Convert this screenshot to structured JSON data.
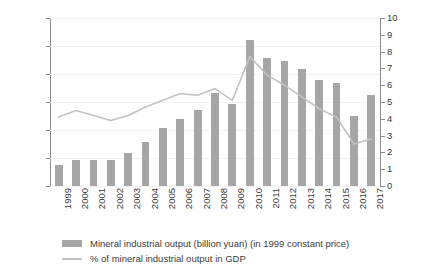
{
  "chart_data": {
    "type": "bar",
    "title": "",
    "subtitle": "",
    "xlabel": "",
    "ylabel": "",
    "grid": true,
    "legend_position": "bottom",
    "categories": [
      "1999",
      "2000",
      "2001",
      "2002",
      "2003",
      "2004",
      "2005",
      "2006",
      "2007",
      "2008",
      "2009",
      "2010",
      "2011",
      "2012",
      "2013",
      "2014",
      "2015",
      "2016",
      "2017"
    ],
    "axes": {
      "left": {
        "label": "",
        "min": 0,
        "max": 3000,
        "step": 500,
        "ticks": [
          "0",
          "500",
          "1,000",
          "1,500",
          "2,000",
          "2,500",
          "3,000"
        ]
      },
      "right": {
        "label": "",
        "min": 0,
        "max": 10,
        "step": 1,
        "ticks": [
          "0",
          "1",
          "2",
          "3",
          "4",
          "5",
          "6",
          "7",
          "8",
          "9",
          "10"
        ]
      }
    },
    "series": [
      {
        "name": "Mineral industrial output (billion yuan) (in 1999 constant price)",
        "type": "bar",
        "axis": "left",
        "color": "#a6a6a6",
        "values": [
          370,
          470,
          470,
          460,
          590,
          780,
          1030,
          1200,
          1350,
          1660,
          1470,
          2600,
          2290,
          2230,
          2090,
          1900,
          1840,
          1250,
          1620
        ]
      },
      {
        "name": "% of mineral industrial output in GDP",
        "type": "line",
        "axis": "right",
        "color": "#c2c2c2",
        "values": [
          4.1,
          4.5,
          4.2,
          3.9,
          4.2,
          4.7,
          5.1,
          5.5,
          5.4,
          5.8,
          5.1,
          7.7,
          6.6,
          6.0,
          5.3,
          4.6,
          4.1,
          2.5,
          2.8
        ]
      }
    ]
  },
  "legend": {
    "items": [
      {
        "label": "Mineral industrial output (billion yuan) (in 1999 constant price)",
        "marker": "bar-swatch"
      },
      {
        "label": "% of mineral industrial output in GDP",
        "marker": "line-swatch"
      }
    ]
  }
}
